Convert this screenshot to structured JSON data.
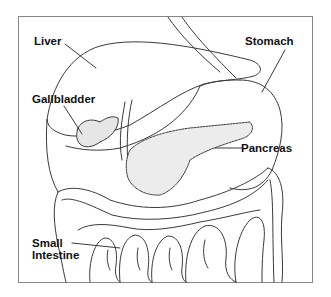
{
  "diagram": {
    "type": "anatomical-illustration",
    "colors": {
      "background": "#ffffff",
      "frame": "#888888",
      "outline": "#3a3a3a",
      "label_text": "#111111"
    },
    "labels": {
      "liver": "Liver",
      "gallbladder": "Gallbladder",
      "stomach": "Stomach",
      "pancreas": "Pancreas",
      "small_intestine_line1": "Small",
      "small_intestine_line2": "Intestine"
    }
  }
}
